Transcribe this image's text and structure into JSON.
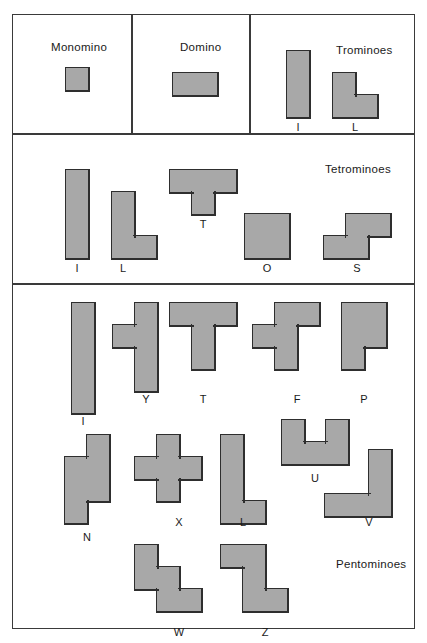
{
  "figure": {
    "cell_size": 22,
    "fill_color": "#a8a8a8",
    "stroke_color": "#2e2e2e",
    "border_color": "#3a3a3a",
    "background": "#ffffff"
  },
  "sections": [
    {
      "id": "monomino",
      "title": "Monomino",
      "title_pos": {
        "x": 38,
        "y": 26
      },
      "pieces": [
        {
          "label": "",
          "cells": [
            [
              0,
              0
            ]
          ],
          "origin": {
            "x": 53,
            "y": 53
          },
          "label_pos": null
        }
      ]
    },
    {
      "id": "domino",
      "title": "Domino",
      "title_pos": {
        "x": 167,
        "y": 26
      },
      "pieces": [
        {
          "label": "",
          "cells": [
            [
              0,
              0
            ],
            [
              1,
              0
            ]
          ],
          "origin": {
            "x": 160,
            "y": 58
          },
          "label_pos": null
        }
      ]
    },
    {
      "id": "trominoes",
      "title": "Trominoes",
      "title_pos": {
        "x": 323,
        "y": 29
      },
      "pieces": [
        {
          "label": "I",
          "cells": [
            [
              0,
              0
            ],
            [
              0,
              1
            ],
            [
              0,
              2
            ]
          ],
          "origin": {
            "x": 274,
            "y": 36
          },
          "label_pos": {
            "x": 274,
            "y": 106
          }
        },
        {
          "label": "L",
          "cells": [
            [
              0,
              0
            ],
            [
              0,
              1
            ],
            [
              1,
              1
            ]
          ],
          "origin": {
            "x": 320,
            "y": 58
          },
          "label_pos": {
            "x": 331,
            "y": 106
          }
        }
      ]
    },
    {
      "id": "tetrominoes",
      "title": "Tetrominoes",
      "title_pos": {
        "x": 312,
        "y": 148
      },
      "pieces": [
        {
          "label": "I",
          "cells": [
            [
              0,
              0
            ],
            [
              0,
              1
            ],
            [
              0,
              2
            ],
            [
              0,
              3
            ]
          ],
          "origin": {
            "x": 53,
            "y": 155
          },
          "label_pos": {
            "x": 53,
            "y": 247
          }
        },
        {
          "label": "L",
          "cells": [
            [
              0,
              0
            ],
            [
              0,
              1
            ],
            [
              0,
              2
            ],
            [
              1,
              2
            ]
          ],
          "origin": {
            "x": 99,
            "y": 177
          },
          "label_pos": {
            "x": 99,
            "y": 247
          }
        },
        {
          "label": "T",
          "cells": [
            [
              0,
              0
            ],
            [
              1,
              0
            ],
            [
              2,
              0
            ],
            [
              1,
              1
            ]
          ],
          "origin": {
            "x": 157,
            "y": 155
          },
          "label_pos": {
            "x": 179,
            "y": 203
          }
        },
        {
          "label": "O",
          "cells": [
            [
              0,
              0
            ],
            [
              1,
              0
            ],
            [
              0,
              1
            ],
            [
              1,
              1
            ]
          ],
          "origin": {
            "x": 232,
            "y": 199
          },
          "label_pos": {
            "x": 243,
            "y": 247
          }
        },
        {
          "label": "S",
          "cells": [
            [
              1,
              0
            ],
            [
              2,
              0
            ],
            [
              0,
              1
            ],
            [
              1,
              1
            ]
          ],
          "origin": {
            "x": 311,
            "y": 199
          },
          "label_pos": {
            "x": 333,
            "y": 247
          }
        }
      ]
    },
    {
      "id": "pentominoes",
      "title": "Pentominoes",
      "title_pos": {
        "x": 323,
        "y": 543
      },
      "pieces": [
        {
          "label": "I",
          "cells": [
            [
              0,
              0
            ],
            [
              0,
              1
            ],
            [
              0,
              2
            ],
            [
              0,
              3
            ],
            [
              0,
              4
            ]
          ],
          "origin": {
            "x": 59,
            "y": 288
          },
          "label_pos": {
            "x": 59,
            "y": 400
          }
        },
        {
          "label": "Y",
          "cells": [
            [
              1,
              0
            ],
            [
              0,
              1
            ],
            [
              1,
              1
            ],
            [
              1,
              2
            ],
            [
              1,
              3
            ]
          ],
          "origin": {
            "x": 100,
            "y": 288
          },
          "label_pos": {
            "x": 122,
            "y": 378
          }
        },
        {
          "label": "T",
          "cells": [
            [
              0,
              0
            ],
            [
              1,
              0
            ],
            [
              2,
              0
            ],
            [
              1,
              1
            ],
            [
              1,
              2
            ]
          ],
          "origin": {
            "x": 157,
            "y": 288
          },
          "label_pos": {
            "x": 179,
            "y": 378
          }
        },
        {
          "label": "F",
          "cells": [
            [
              1,
              0
            ],
            [
              2,
              0
            ],
            [
              0,
              1
            ],
            [
              1,
              1
            ],
            [
              1,
              2
            ]
          ],
          "origin": {
            "x": 240,
            "y": 288
          },
          "label_pos": {
            "x": 273,
            "y": 378
          }
        },
        {
          "label": "P",
          "cells": [
            [
              0,
              0
            ],
            [
              1,
              0
            ],
            [
              0,
              1
            ],
            [
              1,
              1
            ],
            [
              0,
              2
            ]
          ],
          "origin": {
            "x": 329,
            "y": 288
          },
          "label_pos": {
            "x": 340,
            "y": 378
          }
        },
        {
          "label": "N",
          "cells": [
            [
              1,
              0
            ],
            [
              1,
              1
            ],
            [
              0,
              1
            ],
            [
              0,
              2
            ],
            [
              1,
              2
            ],
            [
              0,
              3
            ]
          ],
          "origin": {
            "x": 52,
            "y": 420
          },
          "label_pos": {
            "x": 63,
            "y": 516
          }
        },
        {
          "label": "X",
          "cells": [
            [
              1,
              0
            ],
            [
              0,
              1
            ],
            [
              1,
              1
            ],
            [
              2,
              1
            ],
            [
              1,
              2
            ]
          ],
          "origin": {
            "x": 122,
            "y": 420
          },
          "label_pos": {
            "x": 155,
            "y": 501
          }
        },
        {
          "label": "L",
          "cells": [
            [
              0,
              0
            ],
            [
              0,
              1
            ],
            [
              0,
              2
            ],
            [
              0,
              3
            ],
            [
              1,
              3
            ]
          ],
          "origin": {
            "x": 208,
            "y": 420
          },
          "label_pos": {
            "x": 219,
            "y": 501
          }
        },
        {
          "label": "U",
          "cells": [
            [
              0,
              0
            ],
            [
              2,
              0
            ],
            [
              0,
              1
            ],
            [
              1,
              1
            ],
            [
              2,
              1
            ]
          ],
          "origin": {
            "x": 269,
            "y": 405
          },
          "label_pos": {
            "x": 291,
            "y": 457
          }
        },
        {
          "label": "V",
          "cells": [
            [
              2,
              0
            ],
            [
              2,
              1
            ],
            [
              0,
              2
            ],
            [
              1,
              2
            ],
            [
              2,
              2
            ]
          ],
          "origin": {
            "x": 312,
            "y": 435
          },
          "label_pos": {
            "x": 345,
            "y": 501
          }
        },
        {
          "label": "W",
          "cells": [
            [
              0,
              0
            ],
            [
              0,
              1
            ],
            [
              1,
              1
            ],
            [
              1,
              2
            ],
            [
              2,
              2
            ]
          ],
          "origin": {
            "x": 122,
            "y": 530
          },
          "label_pos": {
            "x": 155,
            "y": 611
          }
        },
        {
          "label": "Z",
          "cells": [
            [
              0,
              0
            ],
            [
              1,
              0
            ],
            [
              1,
              1
            ],
            [
              1,
              2
            ],
            [
              2,
              2
            ]
          ],
          "origin": {
            "x": 208,
            "y": 530
          },
          "label_pos": {
            "x": 241,
            "y": 611
          }
        }
      ]
    }
  ],
  "dividers": {
    "horizontal": [
      118,
      268
    ],
    "vertical": [
      {
        "x": 118,
        "y0": 0,
        "y1": 118
      },
      {
        "x": 236,
        "y0": 0,
        "y1": 118
      }
    ]
  }
}
